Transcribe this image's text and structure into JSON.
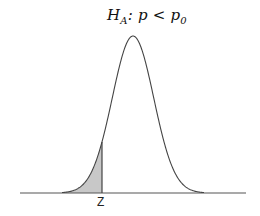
{
  "diagram": {
    "title": {
      "h": "H",
      "h_sub": "A",
      "middle": ": p < p",
      "p_sub": "0"
    },
    "critical_label": "Z",
    "distribution": "normal",
    "shaded_region": "left tail",
    "colors": {
      "curve": "#444444",
      "axis": "#555555",
      "shade": "#c8c8c8"
    }
  }
}
